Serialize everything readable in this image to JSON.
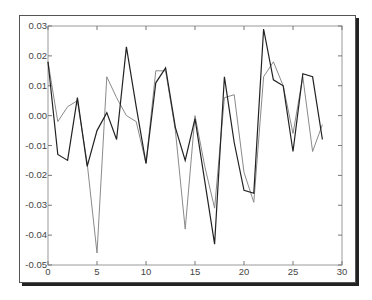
{
  "chart_data": {
    "type": "line",
    "title": "",
    "xlabel": "",
    "ylabel": "",
    "xlim": [
      0,
      30
    ],
    "ylim": [
      -0.05,
      0.03
    ],
    "grid": false,
    "legend": null,
    "xticks": [
      0,
      5,
      10,
      15,
      20,
      25,
      30
    ],
    "xtick_labels": [
      "0",
      "5",
      "10",
      "15",
      "20",
      "25",
      "30"
    ],
    "yticks": [
      0.03,
      0.02,
      0.01,
      0.0,
      -0.01,
      -0.02,
      -0.03,
      -0.04,
      -0.05
    ],
    "ytick_labels": [
      "0.03",
      "0.02",
      "0.01",
      "0.00",
      "-0.01",
      "-0.02",
      "-0.03",
      "-0.04",
      "-0.05"
    ],
    "x": [
      0,
      1,
      2,
      3,
      4,
      5,
      6,
      7,
      8,
      9,
      10,
      11,
      12,
      13,
      14,
      15,
      16,
      17,
      18,
      19,
      20,
      21,
      22,
      23,
      24,
      25,
      26,
      27,
      28
    ],
    "series": [
      {
        "name": "series-dark",
        "color": "#222222",
        "values": [
          0.018,
          -0.013,
          -0.015,
          0.006,
          -0.017,
          -0.005,
          0.001,
          -0.008,
          0.023,
          0.003,
          -0.016,
          0.011,
          0.016,
          -0.004,
          -0.015,
          -0.001,
          -0.022,
          -0.043,
          0.013,
          -0.009,
          -0.025,
          -0.026,
          0.029,
          0.012,
          0.01,
          -0.012,
          0.014,
          0.013,
          -0.008
        ]
      },
      {
        "name": "series-light",
        "color": "#8a8a8a",
        "values": [
          0.018,
          -0.002,
          0.003,
          0.005,
          -0.016,
          -0.046,
          0.013,
          0.006,
          0.0,
          -0.002,
          -0.016,
          0.015,
          0.015,
          -0.005,
          -0.038,
          0.0,
          -0.017,
          -0.031,
          0.006,
          0.007,
          -0.019,
          -0.029,
          0.013,
          0.018,
          0.01,
          -0.006,
          0.013,
          -0.012,
          -0.003
        ]
      }
    ]
  }
}
